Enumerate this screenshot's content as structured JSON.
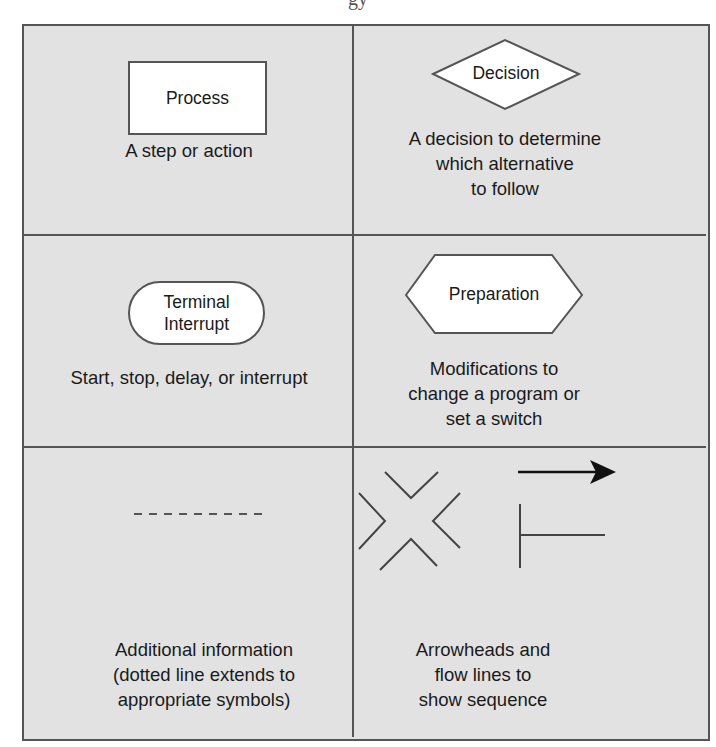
{
  "header": {
    "title_fragment": "gy"
  },
  "symbols": [
    {
      "id": "process",
      "shape": "rectangle",
      "label": "Process",
      "description_lines": [
        "A step or action"
      ]
    },
    {
      "id": "decision",
      "shape": "diamond",
      "label": "Decision",
      "description_lines": [
        "A decision to determine",
        "which alternative",
        "to follow"
      ]
    },
    {
      "id": "terminal",
      "shape": "rounded-terminal",
      "label_lines": [
        "Terminal",
        "Interrupt"
      ],
      "description_lines": [
        "Start, stop, delay, or interrupt"
      ]
    },
    {
      "id": "preparation",
      "shape": "hexagon",
      "label": "Preparation",
      "description_lines": [
        "Modifications to",
        "change a program or",
        "set a switch"
      ]
    },
    {
      "id": "annotation",
      "shape": "dashed-line",
      "description_lines": [
        "Additional information",
        "(dotted line extends to",
        "appropriate symbols)"
      ]
    },
    {
      "id": "flow",
      "shape": "arrowheads-and-flow-lines",
      "description_lines": [
        "Arrowheads and",
        "flow lines to",
        "show sequence"
      ]
    }
  ],
  "colors": {
    "cell_background": "#e2e2e2",
    "grid_line": "#555555",
    "shape_fill": "#ffffff",
    "shape_stroke": "#555555",
    "text": "#1a1a1a",
    "arrow": "#111111"
  }
}
